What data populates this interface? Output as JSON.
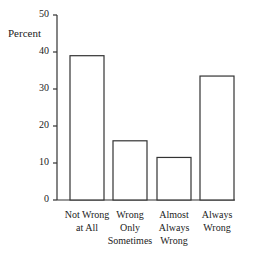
{
  "chart_data": {
    "type": "bar",
    "title": "",
    "xlabel": "",
    "ylabel": "Percent",
    "ylim": [
      0,
      50
    ],
    "yticks": [
      0,
      10,
      20,
      30,
      40,
      50
    ],
    "categories": [
      "Not Wrong at All",
      "Wrong Only Sometimes",
      "Almost Always Wrong",
      "Always Wrong"
    ],
    "category_lines": [
      [
        "Not Wrong",
        "at All"
      ],
      [
        "Wrong",
        "Only",
        "Sometimes"
      ],
      [
        "Almost",
        "Always",
        "Wrong"
      ],
      [
        "Always",
        "Wrong"
      ]
    ],
    "values": [
      39,
      16,
      11.5,
      33.5
    ],
    "grid": false,
    "legend": null,
    "bar_fill": "#ffffff",
    "bar_stroke": "#333333"
  }
}
